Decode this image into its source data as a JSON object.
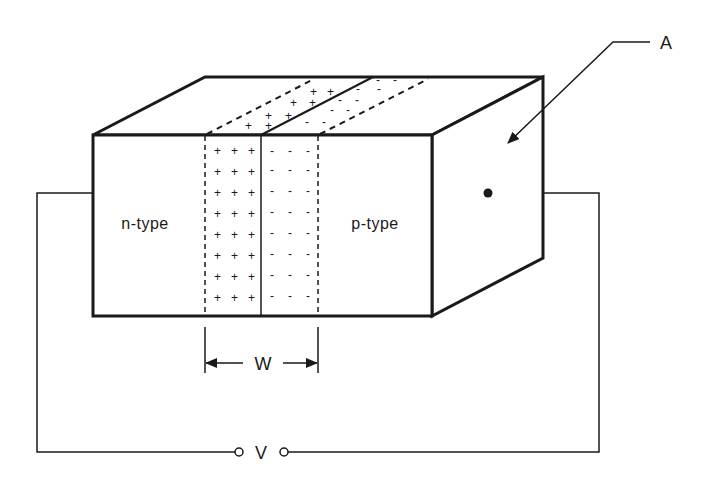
{
  "diagram": {
    "type": "pn-junction-block",
    "labels": {
      "n_region": "n-type",
      "p_region": "p-type",
      "area": "A",
      "width": "W",
      "voltage": "V"
    },
    "depletion_region": {
      "n_side_charge": "+",
      "p_side_charge": "-",
      "rows": 8,
      "columns_per_side": 3
    },
    "colors": {
      "stroke": "#1a1a1a",
      "background": "#ffffff"
    }
  }
}
